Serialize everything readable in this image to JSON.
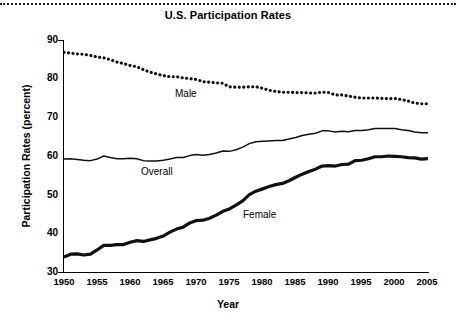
{
  "chart_data": {
    "type": "line",
    "title": "U.S. Participation Rates",
    "xlabel": "Year",
    "ylabel": "Participation Rates (percent)",
    "xlim": [
      1950,
      2005
    ],
    "ylim": [
      30,
      90
    ],
    "xticks": [
      "1950",
      "1955",
      "1960",
      "1965",
      "1970",
      "1975",
      "1980",
      "1985",
      "1990",
      "1995",
      "2000",
      "2005"
    ],
    "yticks": [
      "30",
      "40",
      "50",
      "60",
      "70",
      "80",
      "90"
    ],
    "grid": false,
    "legend_position": "inline-annotations",
    "x": [
      1950,
      1951,
      1952,
      1953,
      1954,
      1955,
      1956,
      1957,
      1958,
      1959,
      1960,
      1961,
      1962,
      1963,
      1964,
      1965,
      1966,
      1967,
      1968,
      1969,
      1970,
      1971,
      1972,
      1973,
      1974,
      1975,
      1976,
      1977,
      1978,
      1979,
      1980,
      1981,
      1982,
      1983,
      1984,
      1985,
      1986,
      1987,
      1988,
      1989,
      1990,
      1991,
      1992,
      1993,
      1994,
      1995,
      1996,
      1997,
      1998,
      1999,
      2000,
      2001,
      2002,
      2003,
      2004,
      2005
    ],
    "series": [
      {
        "name": "Male",
        "style": "dotted",
        "values": [
          86.8,
          86.6,
          86.4,
          86.3,
          86.0,
          85.6,
          85.4,
          84.9,
          84.3,
          83.9,
          83.4,
          83.1,
          82.3,
          81.7,
          81.2,
          80.8,
          80.5,
          80.5,
          80.2,
          80.0,
          79.8,
          79.2,
          79.1,
          78.9,
          78.8,
          77.9,
          77.8,
          77.8,
          77.9,
          77.9,
          77.5,
          77.0,
          76.7,
          76.5,
          76.5,
          76.4,
          76.4,
          76.3,
          76.3,
          76.5,
          76.4,
          75.8,
          75.8,
          75.5,
          75.2,
          75.0,
          75.0,
          75.0,
          74.9,
          74.8,
          74.9,
          74.6,
          74.2,
          73.7,
          73.5,
          73.5
        ]
      },
      {
        "name": "Overall",
        "style": "solid-thin",
        "values": [
          59.2,
          59.3,
          59.1,
          58.9,
          58.8,
          59.2,
          60.0,
          59.6,
          59.3,
          59.3,
          59.4,
          59.3,
          58.8,
          58.7,
          58.7,
          58.9,
          59.2,
          59.6,
          59.6,
          60.1,
          60.4,
          60.2,
          60.4,
          60.8,
          61.3,
          61.2,
          61.6,
          62.3,
          63.2,
          63.7,
          63.8,
          63.9,
          64.0,
          64.0,
          64.4,
          64.8,
          65.3,
          65.6,
          65.9,
          66.5,
          66.5,
          66.2,
          66.4,
          66.3,
          66.6,
          66.6,
          66.8,
          67.1,
          67.1,
          67.1,
          67.1,
          66.8,
          66.6,
          66.2,
          66.0,
          66.0
        ]
      },
      {
        "name": "Female",
        "style": "solid-thick",
        "values": [
          33.9,
          34.6,
          34.7,
          34.4,
          34.6,
          35.7,
          36.9,
          36.9,
          37.1,
          37.1,
          37.7,
          38.1,
          37.9,
          38.3,
          38.7,
          39.3,
          40.3,
          41.1,
          41.6,
          42.7,
          43.3,
          43.4,
          43.9,
          44.7,
          45.7,
          46.3,
          47.3,
          48.4,
          50.0,
          50.9,
          51.5,
          52.1,
          52.6,
          52.9,
          53.6,
          54.5,
          55.3,
          56.0,
          56.6,
          57.4,
          57.5,
          57.4,
          57.8,
          57.9,
          58.8,
          58.9,
          59.3,
          59.8,
          59.8,
          60.0,
          59.9,
          59.8,
          59.6,
          59.5,
          59.2,
          59.3
        ]
      }
    ]
  }
}
